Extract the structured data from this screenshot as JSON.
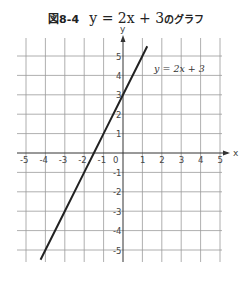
{
  "title": {
    "figure_label": "図8-4",
    "equation": "y = 2x + 3",
    "suffix": "のグラフ"
  },
  "chart_data": {
    "type": "line",
    "title": "図8-4 y = 2x + 3のグラフ",
    "xlabel": "x",
    "ylabel": "y",
    "xlim": [
      -5.5,
      5.5
    ],
    "ylim": [
      -5.5,
      5.5
    ],
    "grid": true,
    "x_ticks": [
      -5,
      -4,
      -3,
      -2,
      -1,
      0,
      1,
      2,
      3,
      4,
      5
    ],
    "y_ticks": [
      -5,
      -4,
      -3,
      -2,
      -1,
      1,
      2,
      3,
      4,
      5
    ],
    "series": [
      {
        "name": "y = 2x + 3",
        "slope": 2,
        "intercept": 3,
        "x": [
          -4.25,
          -4,
          -3,
          -2,
          -1.5,
          -1,
          0,
          1,
          1.25
        ],
        "y": [
          -5.5,
          -5,
          -3,
          -1,
          0,
          1,
          3,
          5,
          5.5
        ]
      }
    ],
    "annotations": [
      {
        "text": "y = 2x + 3",
        "x": 1.6,
        "y": 4.2
      }
    ]
  },
  "axis": {
    "x_label": "x",
    "y_label": "y",
    "origin_label": "0",
    "x_tick_labels": [
      "-5",
      "-4",
      "-3",
      "-2",
      "-1",
      "1",
      "2",
      "3",
      "4",
      "5"
    ],
    "y_tick_labels": [
      "5",
      "4",
      "3",
      "2",
      "1",
      "-1",
      "-2",
      "-3",
      "-4",
      "-5"
    ]
  },
  "line_label": "y = 2x + 3",
  "colors": {
    "grid": "#9a9a9a",
    "axis": "#333333",
    "line": "#222222",
    "text": "#444444"
  }
}
